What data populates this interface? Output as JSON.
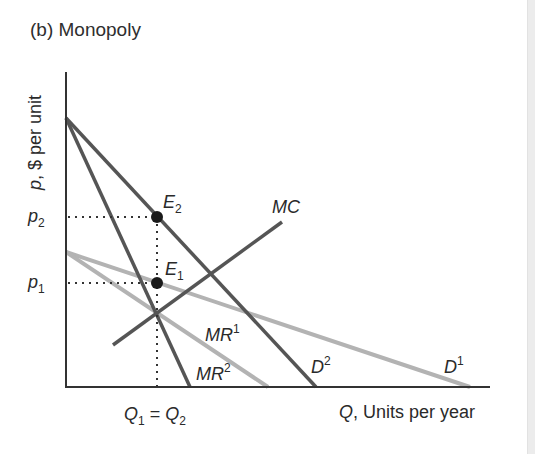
{
  "title": "(b) Monopoly",
  "axes": {
    "y_label_var": "p",
    "y_label_rest": ", $ per unit",
    "x_label_var": "Q",
    "x_label_rest": ", Units per year"
  },
  "ticks": {
    "p2": {
      "base": "p",
      "sub": "2"
    },
    "p1": {
      "base": "p",
      "sub": "1"
    },
    "q": {
      "left_base": "Q",
      "left_sub": "1",
      "eq": " = ",
      "right_base": "Q",
      "right_sub": "2"
    }
  },
  "curves": {
    "mc": {
      "label": "MC"
    },
    "d1": {
      "base": "D",
      "sup": "1"
    },
    "d2": {
      "base": "D",
      "sup": "2"
    },
    "mr1": {
      "base": "MR",
      "sup": "1"
    },
    "mr2": {
      "base": "MR",
      "sup": "2"
    }
  },
  "points": {
    "e1": {
      "base": "E",
      "sub": "1"
    },
    "e2": {
      "base": "E",
      "sub": "2"
    }
  },
  "colors": {
    "dark_line": "#555555",
    "light_line": "#b3b3b3",
    "axis": "#333333",
    "point": "#1a1a1a"
  }
}
